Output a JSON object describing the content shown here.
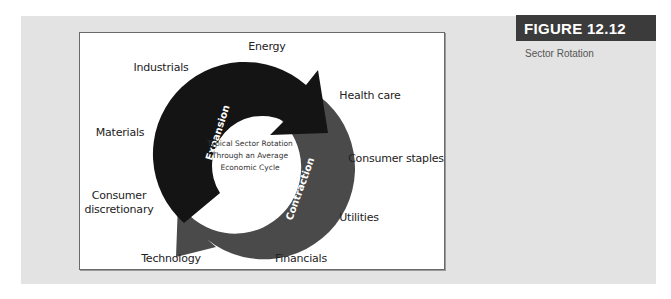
{
  "figure": {
    "number_label": "FIGURE 12.12",
    "caption": "Sector Rotation"
  },
  "diagram": {
    "center_text": [
      "Typical Sector Rotation",
      "Through an Average",
      "Economic Cycle"
    ],
    "arrows": [
      {
        "label": "Expansion",
        "color": "#1a1a1a"
      },
      {
        "label": "Contraction",
        "color": "#4a4a4a"
      }
    ],
    "sectors": [
      {
        "name": "Energy"
      },
      {
        "name": "Industrials"
      },
      {
        "name": "Health care"
      },
      {
        "name": "Materials"
      },
      {
        "name": "Consumer staples"
      },
      {
        "name_line1": "Consumer",
        "name_line2": "discretionary"
      },
      {
        "name": "Utilities"
      },
      {
        "name": "Technology"
      },
      {
        "name": "Financials"
      }
    ]
  },
  "colors": {
    "panel_bg": "#e3e3e3",
    "header_bg": "#3b3b3b",
    "expansion": "#1a1a1a",
    "contraction": "#4a4a4a"
  }
}
